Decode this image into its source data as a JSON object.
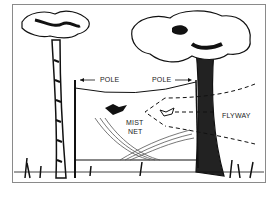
{
  "figure": {
    "labels": {
      "pole_left": "POLE",
      "pole_right": "POLE",
      "net_line1": "MIST",
      "net_line2": "NET",
      "flyway": "FLYWAY"
    },
    "colors": {
      "ink": "#111111",
      "frame": "#8a8a8a",
      "background": "#ffffff"
    }
  }
}
